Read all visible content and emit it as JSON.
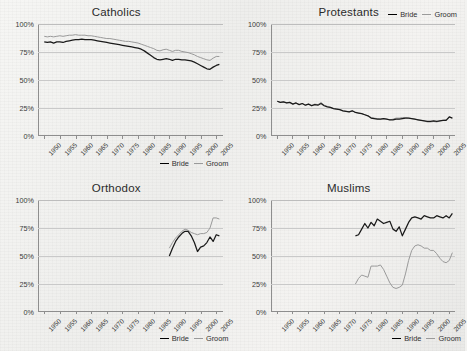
{
  "figure": {
    "background_color": "#f1f1ef",
    "series_colors": {
      "bride": "#1a1a1a",
      "groom": "#9a9a9a"
    }
  },
  "legend": {
    "bride_label": "Bride",
    "groom_label": "Groom"
  },
  "axis": {
    "y_ticks": [
      "100%",
      "75%",
      "50%",
      "25%",
      "0%"
    ],
    "y_values": [
      100,
      75,
      50,
      25,
      0
    ],
    "x_ticks": [
      "1950",
      "1955",
      "1960",
      "1965",
      "1970",
      "1975",
      "1980",
      "1985",
      "1990",
      "1995",
      "2000",
      "2005"
    ],
    "x_min": 1948,
    "x_max": 2007
  },
  "chart_data": [
    {
      "type": "line",
      "title": "Catholics",
      "xlabel": "",
      "ylabel": "",
      "ylim": [
        0,
        100
      ],
      "xlim": [
        1948,
        2007
      ],
      "grid": true,
      "legend_position": "bottom-right",
      "x": [
        1950,
        1951,
        1952,
        1953,
        1954,
        1955,
        1956,
        1957,
        1958,
        1959,
        1960,
        1961,
        1962,
        1963,
        1964,
        1965,
        1966,
        1967,
        1968,
        1969,
        1970,
        1971,
        1972,
        1973,
        1974,
        1975,
        1976,
        1977,
        1978,
        1979,
        1980,
        1981,
        1982,
        1983,
        1984,
        1985,
        1986,
        1987,
        1988,
        1989,
        1990,
        1991,
        1992,
        1993,
        1994,
        1995,
        1996,
        1997,
        1998,
        1999,
        2000,
        2001,
        2002,
        2003,
        2004,
        2005,
        2006
      ],
      "series": [
        {
          "name": "Bride",
          "values": [
            84,
            83.5,
            84,
            83,
            84,
            84,
            83.5,
            84.5,
            85,
            85.5,
            86,
            86,
            86.5,
            86,
            86,
            86,
            85.5,
            85,
            84.5,
            84,
            83.5,
            83,
            82.5,
            82,
            81.5,
            81,
            80.5,
            80,
            79.5,
            79,
            78.5,
            77.5,
            76,
            74,
            72,
            70,
            68.5,
            68,
            68.5,
            69,
            68.5,
            67.5,
            68.5,
            68.5,
            68,
            68,
            67.5,
            67,
            66,
            64.5,
            63,
            61.5,
            60,
            59.5,
            61.5,
            63,
            64
          ]
        },
        {
          "name": "Groom",
          "values": [
            89,
            88.5,
            89,
            88.5,
            89,
            89.5,
            89,
            89.5,
            90,
            90,
            90.5,
            90,
            90,
            90,
            89.5,
            89.5,
            89,
            88.5,
            88,
            87.5,
            87,
            87,
            86.5,
            86,
            85.5,
            85,
            84.5,
            84.5,
            84,
            83.5,
            83,
            82,
            81,
            80,
            79,
            78,
            76.5,
            76,
            77,
            77.5,
            76.5,
            75.5,
            76.5,
            76.5,
            75.5,
            75,
            74.5,
            73.5,
            72.5,
            71,
            70,
            69,
            68,
            67.5,
            69.5,
            71,
            71
          ]
        }
      ]
    },
    {
      "type": "line",
      "title": "Protestants",
      "xlabel": "",
      "ylabel": "",
      "ylim": [
        0,
        100
      ],
      "xlim": [
        1948,
        2007
      ],
      "grid": true,
      "legend_position": "top-right",
      "x": [
        1950,
        1951,
        1952,
        1953,
        1954,
        1955,
        1956,
        1957,
        1958,
        1959,
        1960,
        1961,
        1962,
        1963,
        1964,
        1965,
        1966,
        1967,
        1968,
        1969,
        1970,
        1971,
        1972,
        1973,
        1974,
        1975,
        1976,
        1977,
        1978,
        1979,
        1980,
        1981,
        1982,
        1983,
        1984,
        1985,
        1986,
        1987,
        1988,
        1989,
        1990,
        1991,
        1992,
        1993,
        1994,
        1995,
        1996,
        1997,
        1998,
        1999,
        2000,
        2001,
        2002,
        2003,
        2004,
        2005,
        2006
      ],
      "series": [
        {
          "name": "Bride",
          "values": [
            31,
            30,
            30.5,
            29.5,
            30,
            28.5,
            29.5,
            28,
            29,
            27.5,
            28.5,
            27,
            28,
            27.5,
            29,
            27,
            26,
            25.5,
            24.5,
            24,
            23.5,
            22.5,
            22,
            21.5,
            22.5,
            21,
            20.5,
            20,
            19,
            18,
            16,
            15.5,
            15,
            15,
            15.5,
            15,
            14.5,
            14.5,
            15,
            15,
            15.5,
            16,
            16,
            15.5,
            15,
            14.5,
            14,
            13.5,
            13,
            13,
            13.5,
            13,
            13.5,
            14,
            14,
            17,
            16
          ]
        },
        {
          "name": "Groom",
          "values": [
            31,
            30,
            30.5,
            29.5,
            30,
            28.5,
            29.5,
            28,
            29,
            27.5,
            28.5,
            27.5,
            28.5,
            28,
            30,
            27.5,
            26.5,
            25.5,
            24.5,
            24,
            23.5,
            22.5,
            22,
            21.5,
            22.5,
            21,
            20.5,
            20,
            19,
            18,
            16.5,
            16,
            15.5,
            15,
            15.5,
            15,
            14.5,
            15,
            16,
            16,
            16.5,
            16.5,
            16,
            15.5,
            15,
            14.5,
            14,
            13.5,
            12.5,
            12.5,
            13,
            12.5,
            13.5,
            14,
            14.5,
            17,
            16
          ]
        }
      ]
    },
    {
      "type": "line",
      "title": "Orthodox",
      "xlabel": "",
      "ylabel": "",
      "ylim": [
        0,
        100
      ],
      "xlim": [
        1948,
        2007
      ],
      "grid": true,
      "legend_position": "bottom-right",
      "x": [
        1990,
        1991,
        1992,
        1993,
        1994,
        1995,
        1996,
        1997,
        1998,
        1999,
        2000,
        2001,
        2002,
        2003,
        2004,
        2005,
        2006
      ],
      "series": [
        {
          "name": "Bride",
          "values": [
            50,
            57,
            63,
            67,
            70,
            72,
            72,
            68,
            62,
            54,
            58,
            59,
            62,
            67,
            63,
            69,
            68
          ]
        },
        {
          "name": "Groom",
          "values": [
            57,
            62,
            66,
            69,
            72,
            74,
            73,
            71,
            70,
            69,
            70,
            70,
            71,
            75,
            84,
            84,
            83
          ]
        }
      ]
    },
    {
      "type": "line",
      "title": "Muslims",
      "xlabel": "",
      "ylabel": "",
      "ylim": [
        0,
        100
      ],
      "xlim": [
        1948,
        2007
      ],
      "grid": true,
      "legend_position": "bottom-right",
      "x": [
        1975,
        1976,
        1977,
        1978,
        1979,
        1980,
        1981,
        1982,
        1983,
        1984,
        1985,
        1986,
        1987,
        1988,
        1989,
        1990,
        1991,
        1992,
        1993,
        1994,
        1995,
        1996,
        1997,
        1998,
        1999,
        2000,
        2001,
        2002,
        2003,
        2004,
        2005,
        2006
      ],
      "series": [
        {
          "name": "Bride",
          "values": [
            68,
            69,
            74,
            79,
            75,
            80,
            77,
            83,
            81,
            79,
            80,
            81,
            74,
            72,
            76,
            68,
            74,
            80,
            84,
            85,
            84,
            83,
            86,
            85,
            84,
            84,
            86,
            85,
            84,
            86,
            84,
            88
          ]
        },
        {
          "name": "Groom",
          "values": [
            25,
            30,
            33,
            32,
            31,
            41,
            41,
            41,
            42,
            38,
            32,
            26,
            22,
            21,
            22,
            24,
            34,
            46,
            55,
            59,
            60,
            59,
            57,
            57,
            55,
            55,
            52,
            48,
            45,
            44,
            46,
            53
          ]
        }
      ]
    }
  ]
}
